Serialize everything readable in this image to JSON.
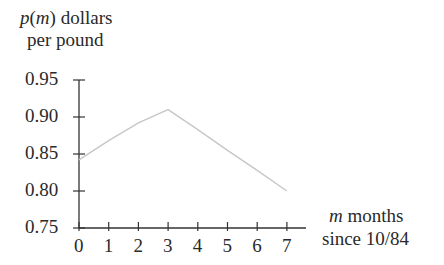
{
  "chart_data": {
    "type": "line",
    "title": "",
    "ylabel": {
      "var": "p",
      "arg": "m",
      "rest": " dollars",
      "line2": "per pound"
    },
    "xlabel": {
      "var": "m",
      "rest": " months",
      "line2": "since 10/84"
    },
    "x": [
      0,
      1,
      2,
      3,
      4,
      5,
      6,
      7
    ],
    "values": [
      0.842,
      0.868,
      0.892,
      0.91,
      0.883,
      0.855,
      0.828,
      0.8
    ],
    "xlim": [
      0,
      7.6
    ],
    "ylim": [
      0.75,
      0.95
    ],
    "x_ticks": [
      "0",
      "1",
      "2",
      "3",
      "4",
      "5",
      "6",
      "7"
    ],
    "y_ticks": [
      "0.95",
      "0.90",
      "0.85",
      "0.80",
      "0.75"
    ],
    "grid": false,
    "legend": null,
    "line_color": "#c8c8c8",
    "axis_color": "#333333"
  }
}
